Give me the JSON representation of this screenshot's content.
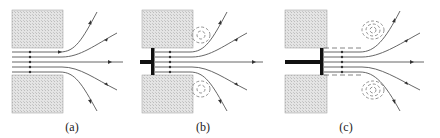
{
  "figure": {
    "panels": [
      {
        "id": "a",
        "label": "(a)",
        "description": "Free jet issuing from orifice between two walls"
      },
      {
        "id": "b",
        "label": "(b)",
        "description": "Piston at orifice exit; vortices form at wall corners"
      },
      {
        "id": "c",
        "label": "(c)",
        "description": "Piston with extended tube (dashed); vortex rings shed downstream"
      }
    ],
    "colors": {
      "wall_fill": "#d8d8d8",
      "line": "#555555",
      "piston": "#111111",
      "dashed": "#777777"
    }
  }
}
